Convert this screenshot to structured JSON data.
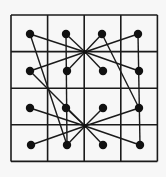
{
  "diagram": {
    "grid": {
      "x0": 11,
      "y0": 15,
      "cell": 36.6,
      "rows": 4,
      "cols": 4,
      "stroke": "#1a1a1a"
    },
    "dots": [
      [
        30,
        34
      ],
      [
        66,
        34
      ],
      [
        102,
        34
      ],
      [
        138,
        34
      ],
      [
        30,
        71
      ],
      [
        67,
        71
      ],
      [
        103,
        71
      ],
      [
        139,
        71
      ],
      [
        30,
        108
      ],
      [
        66,
        108
      ],
      [
        103,
        108
      ],
      [
        139,
        108
      ],
      [
        31,
        145
      ],
      [
        67,
        145
      ],
      [
        103,
        145
      ],
      [
        140,
        145
      ]
    ],
    "hubs": [
      [
        85,
        52
      ],
      [
        85,
        126
      ]
    ],
    "edges": [
      [
        30,
        34,
        85,
        52
      ],
      [
        66,
        34,
        85,
        52
      ],
      [
        102,
        34,
        85,
        52
      ],
      [
        138,
        34,
        85,
        52
      ],
      [
        30,
        71,
        85,
        52
      ],
      [
        139,
        71,
        85,
        52
      ],
      [
        30,
        34,
        67,
        145
      ],
      [
        30,
        71,
        85,
        126
      ],
      [
        66,
        34,
        67,
        145
      ],
      [
        102,
        34,
        139,
        108
      ],
      [
        138,
        34,
        140,
        145
      ],
      [
        67,
        71,
        85,
        52
      ],
      [
        103,
        71,
        85,
        52
      ],
      [
        30,
        108,
        85,
        126
      ],
      [
        66,
        108,
        85,
        126
      ],
      [
        103,
        108,
        85,
        126
      ],
      [
        139,
        108,
        85,
        126
      ],
      [
        31,
        145,
        85,
        126
      ],
      [
        140,
        145,
        85,
        126
      ],
      [
        67,
        145,
        85,
        126
      ],
      [
        103,
        145,
        85,
        126
      ]
    ],
    "dot_color": "#111111"
  }
}
